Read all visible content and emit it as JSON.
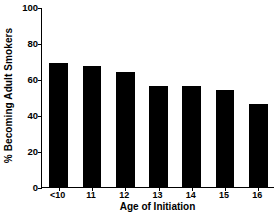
{
  "chart_data": {
    "type": "bar",
    "title": "",
    "xlabel": "Age of Initiation",
    "ylabel": "% Becoming Adult Smokers",
    "categories": [
      "<10",
      "11",
      "12",
      "13",
      "14",
      "15",
      "16"
    ],
    "values": [
      69,
      67,
      64,
      56,
      56,
      54,
      46
    ],
    "ylim": [
      0,
      100
    ],
    "yticks": [
      0,
      20,
      40,
      60,
      80,
      100
    ],
    "ytick_labels": [
      "0",
      "20",
      "40",
      "60",
      "80",
      "100"
    ],
    "grid": false,
    "legend": null,
    "bar_color": "#000000",
    "background_color": "#ffffff",
    "axis_color": "#000000"
  }
}
